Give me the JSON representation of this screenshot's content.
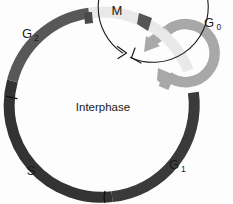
{
  "diagram": {
    "background_color": "#fdfdfd",
    "center_label": "Interphase",
    "labels": {
      "m_phase": "M",
      "g0_phase_main": "G",
      "g0_phase_sub": "0",
      "g1_phase_main": "G",
      "g1_phase_sub": "1",
      "g2_phase_main": "G",
      "g2_phase_sub": "2",
      "s_phase": "S"
    },
    "segments": [
      {
        "name": "M",
        "label": "M",
        "color": "#e9e9e9",
        "start_deg": -22,
        "end_deg": 17
      },
      {
        "name": "G1",
        "label": "G1",
        "color": "#3a3a3a",
        "start_deg": 17,
        "end_deg": 92
      },
      {
        "name": "S",
        "label": "S",
        "color": "#333333",
        "start_deg": 92,
        "end_deg": 182
      },
      {
        "name": "G2",
        "label": "G2",
        "color": "#585858",
        "start_deg": 182,
        "end_deg": 338
      }
    ],
    "g0_loop": {
      "name": "G0",
      "color": "#a8a8a8",
      "center_x": 186,
      "center_y": 52,
      "radius": 29
    },
    "ring": {
      "center_x": 103,
      "center_y": 105,
      "radius": 92,
      "stroke_width": 11
    },
    "inner_arc": {
      "center_x": 103,
      "center_y": 105,
      "radius": 55,
      "color": "#1a1a1a",
      "direction": "clockwise"
    },
    "colors": {
      "m_phase": "#e9e9e9",
      "g0_phase": "#a8a8a8",
      "g1_phase": "#3a3a3a",
      "s_phase": "#333333",
      "g2_phase": "#585858",
      "outline": "#1a1a1a",
      "background": "#fdfdfd"
    }
  }
}
